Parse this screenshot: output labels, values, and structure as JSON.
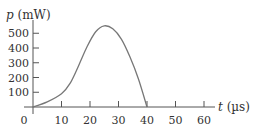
{
  "chart_data": {
    "type": "line",
    "title": "",
    "xlabel": "t (µs)",
    "ylabel": "p (mW)",
    "x_ticks": [
      0,
      10,
      20,
      30,
      40,
      50,
      60
    ],
    "y_ticks": [
      100,
      200,
      300,
      400,
      500
    ],
    "xlim": [
      0,
      65
    ],
    "ylim": [
      0,
      570
    ],
    "grid": false,
    "legend": null,
    "series": [
      {
        "name": "p(t)",
        "x": [
          0,
          5,
          10,
          13,
          16,
          19,
          22,
          25,
          28,
          31,
          34,
          37,
          40
        ],
        "y": [
          0,
          35,
          90,
          160,
          280,
          410,
          510,
          550,
          530,
          460,
          340,
          190,
          0
        ]
      }
    ]
  },
  "labels": {
    "y_axis_var": "p",
    "y_axis_unit": " (mW)",
    "x_axis_var": "t",
    "x_axis_unit": " (µs)",
    "origin": "0"
  }
}
